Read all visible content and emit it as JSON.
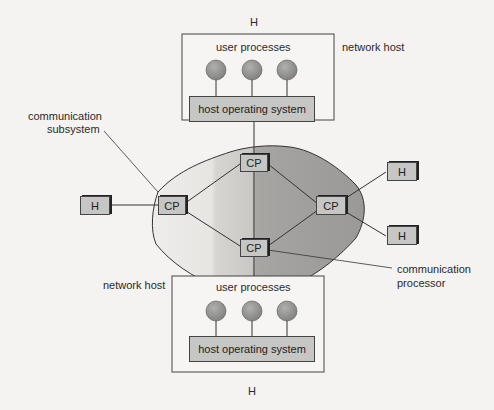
{
  "top_host": {
    "label": "H",
    "caption": "network host",
    "user_processes": "user processes",
    "os": "host operating system",
    "process_count": 3
  },
  "bottom_host": {
    "label": "H",
    "caption": "network host",
    "user_processes": "user processes",
    "os": "host operating system",
    "process_count": 3
  },
  "subsystem_label_line1": "communication",
  "subsystem_label_line2": "subsystem",
  "processor_label_line1": "communication",
  "processor_label_line2": "processor",
  "nodes": {
    "cp_top": "CP",
    "cp_left": "CP",
    "cp_right": "CP",
    "cp_bottom": "CP",
    "h_left": "H",
    "h_right_top": "H",
    "h_right_bottom": "H"
  },
  "colors": {
    "background": "#f4f3f1",
    "cloud_dark": "#9a9a98",
    "cloud_light": "#d4d3d0",
    "box_fill": "#c6c6c4",
    "process_circle": "#8f8f8d",
    "line": "#333333"
  }
}
